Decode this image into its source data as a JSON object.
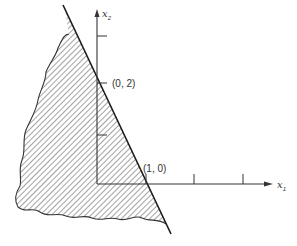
{
  "diagram": {
    "type": "feasible-region-plot",
    "axes": {
      "x": {
        "label_var": "x",
        "label_sub": "1"
      },
      "y": {
        "label_var": "x",
        "label_sub": "2"
      }
    },
    "points": [
      {
        "label": "(0, 2)"
      },
      {
        "label": "(1, 0)"
      }
    ],
    "colors": {
      "line": "#1a1a1a",
      "hatch": "#333333",
      "axis": "#333333"
    }
  }
}
